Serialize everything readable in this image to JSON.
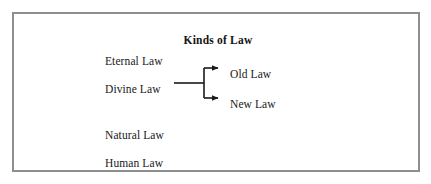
{
  "figure": {
    "title": "Kinds of Law",
    "frame_color": "#8e8e8e",
    "background_color": "#ffffff",
    "text_color": "#191919",
    "line_color": "#1a1a1a",
    "kinds": [
      {
        "id": "eternal",
        "label": "Eternal Law"
      },
      {
        "id": "divine",
        "label": "Divine Law"
      },
      {
        "id": "natural",
        "label": "Natural Law"
      },
      {
        "id": "human",
        "label": "Human Law"
      }
    ],
    "divine_branches": [
      {
        "id": "old",
        "label": "Old Law"
      },
      {
        "id": "new",
        "label": "New Law"
      }
    ]
  }
}
